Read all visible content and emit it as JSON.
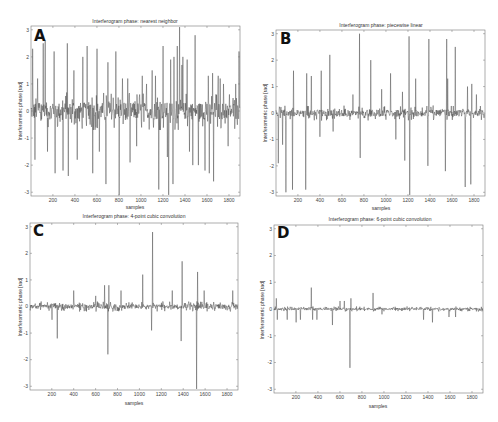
{
  "chart_data": [
    {
      "type": "line",
      "panel_letter": "A",
      "title": "Interferogram phase: nearest neighbor",
      "xlabel": "samples",
      "ylabel": "Interferometric phase [rad]",
      "xlim": [
        1,
        1900
      ],
      "ylim": [
        -3.14,
        3.14
      ],
      "xticks": [
        200,
        400,
        600,
        800,
        1000,
        1200,
        1400,
        1600,
        1800
      ],
      "yticks": [
        -3,
        -2,
        -1,
        0,
        1,
        2,
        3
      ],
      "noise_amplitude": 0.45,
      "spikes": [
        [
          15,
          2.3
        ],
        [
          35,
          -1.8
        ],
        [
          60,
          1.2
        ],
        [
          110,
          2.5
        ],
        [
          130,
          2.6
        ],
        [
          150,
          -1.5
        ],
        [
          210,
          2.2
        ],
        [
          220,
          -2.3
        ],
        [
          290,
          -2.2
        ],
        [
          330,
          2.5
        ],
        [
          340,
          -2.4
        ],
        [
          390,
          1.5
        ],
        [
          420,
          -1.8
        ],
        [
          470,
          2.0
        ],
        [
          510,
          2.4
        ],
        [
          560,
          -2.3
        ],
        [
          600,
          2.3
        ],
        [
          620,
          -1.5
        ],
        [
          680,
          -2.7
        ],
        [
          700,
          1.8
        ],
        [
          770,
          2.2
        ],
        [
          800,
          -3.1
        ],
        [
          830,
          1.2
        ],
        [
          880,
          1.2
        ],
        [
          900,
          -1.9
        ],
        [
          960,
          -1.3
        ],
        [
          1010,
          1.3
        ],
        [
          1050,
          1.0
        ],
        [
          1100,
          1.5
        ],
        [
          1130,
          1.3
        ],
        [
          1160,
          -2.9
        ],
        [
          1200,
          2.4
        ],
        [
          1240,
          -1.7
        ],
        [
          1250,
          -3.1
        ],
        [
          1270,
          1.9
        ],
        [
          1290,
          -2.7
        ],
        [
          1300,
          2.0
        ],
        [
          1330,
          2.4
        ],
        [
          1350,
          3.1
        ],
        [
          1370,
          1.7
        ],
        [
          1380,
          2.0
        ],
        [
          1420,
          1.9
        ],
        [
          1440,
          -1.5
        ],
        [
          1470,
          -2.0
        ],
        [
          1490,
          2.8
        ],
        [
          1520,
          -2.0
        ],
        [
          1580,
          -2.2
        ],
        [
          1610,
          1.3
        ],
        [
          1620,
          -2.3
        ],
        [
          1650,
          1.4
        ],
        [
          1660,
          -2.6
        ],
        [
          1700,
          1.3
        ],
        [
          1720,
          1.2
        ],
        [
          1750,
          1.0
        ],
        [
          1790,
          -1.3
        ],
        [
          1860,
          1.0
        ],
        [
          1890,
          2.2
        ]
      ]
    },
    {
      "type": "line",
      "panel_letter": "B",
      "title": "Interferogram phase: piecewise linear",
      "xlabel": "samples",
      "ylabel": "Interferometric phase [rad]",
      "xlim": [
        1,
        1900
      ],
      "ylim": [
        -3.14,
        3.14
      ],
      "xticks": [
        200,
        400,
        600,
        800,
        1000,
        1200,
        1400,
        1600,
        1800
      ],
      "yticks": [
        -3,
        -2,
        -1,
        0,
        1,
        2,
        3
      ],
      "noise_amplitude": 0.18,
      "spikes": [
        [
          20,
          -1.9
        ],
        [
          60,
          -1.2
        ],
        [
          90,
          -3.0
        ],
        [
          150,
          -2.9
        ],
        [
          160,
          1.6
        ],
        [
          270,
          -2.9
        ],
        [
          280,
          1.5
        ],
        [
          320,
          1.4
        ],
        [
          410,
          1.6
        ],
        [
          400,
          -0.9
        ],
        [
          490,
          2.2
        ],
        [
          520,
          -0.7
        ],
        [
          700,
          0.7
        ],
        [
          760,
          3.0
        ],
        [
          765,
          -1.7
        ],
        [
          860,
          2.0
        ],
        [
          960,
          0.9
        ],
        [
          1040,
          1.5
        ],
        [
          1090,
          -1.0
        ],
        [
          1150,
          0.8
        ],
        [
          1170,
          -1.8
        ],
        [
          1210,
          2.9
        ],
        [
          1215,
          -3.1
        ],
        [
          1270,
          1.3
        ],
        [
          1380,
          -2.0
        ],
        [
          1390,
          2.8
        ],
        [
          1540,
          -2.2
        ],
        [
          1550,
          2.8
        ],
        [
          1560,
          1.3
        ],
        [
          1630,
          2.5
        ],
        [
          1720,
          -2.8
        ],
        [
          1740,
          1.0
        ],
        [
          1770,
          -2.7
        ],
        [
          1780,
          1.1
        ],
        [
          1820,
          0.7
        ]
      ]
    },
    {
      "type": "line",
      "panel_letter": "C",
      "title": "Interferogram phase: 4-point cubic convolution",
      "xlabel": "samples",
      "ylabel": "Interferometric phase [rad]",
      "xlim": [
        1,
        1900
      ],
      "ylim": [
        -3.14,
        3.14
      ],
      "xticks": [
        200,
        400,
        600,
        800,
        1000,
        1200,
        1400,
        1600,
        1800
      ],
      "yticks": [
        -3,
        -2,
        -1,
        0,
        1,
        2,
        3
      ],
      "noise_amplitude": 0.12,
      "spikes": [
        [
          200,
          -0.5
        ],
        [
          250,
          -1.2
        ],
        [
          400,
          0.6
        ],
        [
          600,
          0.4
        ],
        [
          680,
          0.8
        ],
        [
          710,
          -1.8
        ],
        [
          720,
          0.8
        ],
        [
          830,
          0.6
        ],
        [
          1030,
          1.2
        ],
        [
          1110,
          -0.9
        ],
        [
          1120,
          2.8
        ],
        [
          1300,
          0.6
        ],
        [
          1380,
          -1.3
        ],
        [
          1390,
          1.7
        ],
        [
          1520,
          -3.1
        ],
        [
          1530,
          1.3
        ],
        [
          1590,
          0.6
        ],
        [
          1850,
          0.6
        ]
      ]
    },
    {
      "type": "line",
      "panel_letter": "D",
      "title": "Interferogram phase: 6-point cubic convolution",
      "xlabel": "samples",
      "ylabel": "Interferometric phase [rad]",
      "xlim": [
        1,
        1900
      ],
      "ylim": [
        -3.14,
        3.14
      ],
      "xticks": [
        200,
        400,
        600,
        800,
        1000,
        1200,
        1400,
        1600,
        1800
      ],
      "yticks": [
        -3,
        -2,
        -1,
        0,
        1,
        2,
        3
      ],
      "noise_amplitude": 0.06,
      "spikes": [
        [
          20,
          0.4
        ],
        [
          30,
          -0.4
        ],
        [
          120,
          -0.4
        ],
        [
          200,
          -0.5
        ],
        [
          240,
          -0.4
        ],
        [
          340,
          0.8
        ],
        [
          350,
          -0.4
        ],
        [
          390,
          -0.4
        ],
        [
          530,
          -0.6
        ],
        [
          600,
          0.3
        ],
        [
          640,
          0.3
        ],
        [
          690,
          -2.2
        ],
        [
          700,
          0.4
        ],
        [
          900,
          0.6
        ],
        [
          980,
          -0.2
        ],
        [
          1360,
          -0.4
        ],
        [
          1440,
          -0.5
        ],
        [
          1590,
          -0.3
        ],
        [
          1650,
          -0.3
        ]
      ]
    }
  ],
  "panels": [
    {
      "letter": "A",
      "title": "Interferogram phase: nearest neighbor",
      "xlabel": "samples",
      "ylabel": "Interferometric phase [rad]"
    },
    {
      "letter": "B",
      "title": "Interferogram phase: piecewise linear",
      "xlabel": "samples",
      "ylabel": "Interferometric phase [rad]"
    },
    {
      "letter": "C",
      "title": "Interferogram phase: 4-point cubic convolution",
      "xlabel": "samples",
      "ylabel": "Interferometric phase [rad]"
    },
    {
      "letter": "D",
      "title": "Interferogram phase: 6-point cubic convolution",
      "xlabel": "samples",
      "ylabel": "Interferometric phase [rad]"
    }
  ]
}
